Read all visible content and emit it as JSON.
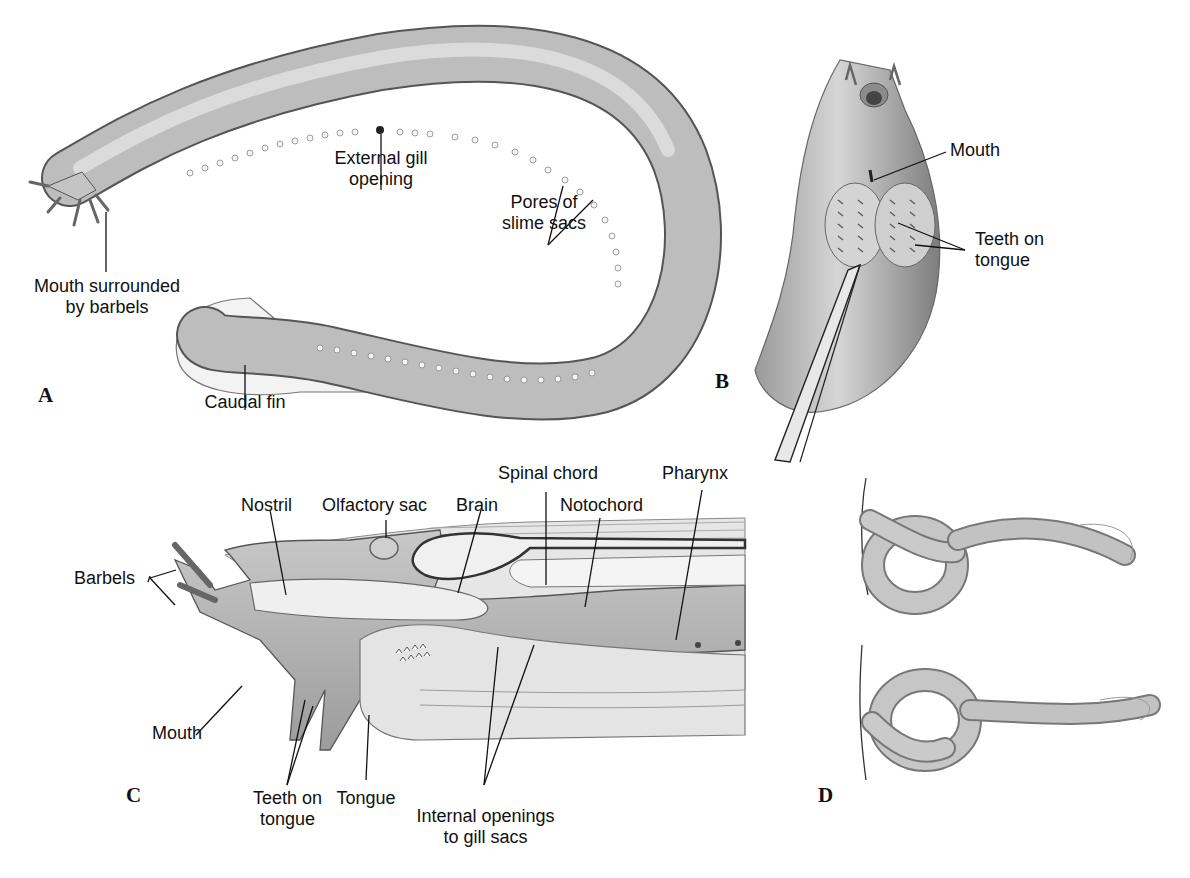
{
  "figure": {
    "panels": [
      {
        "id": "A",
        "letter": "A",
        "labels": {
          "mouth": "Mouth surrounded\nby barbels",
          "mouth_line1": "Mouth surrounded",
          "mouth_line2": "by barbels",
          "gill_line1": "External gill",
          "gill_line2": "opening",
          "pores_line1": "Pores of",
          "pores_line2": "slime sacs",
          "caudal": "Caudal fin"
        }
      },
      {
        "id": "B",
        "letter": "B",
        "labels": {
          "mouth": "Mouth",
          "teeth_line1": "Teeth on",
          "teeth_line2": "tongue"
        }
      },
      {
        "id": "C",
        "letter": "C",
        "labels": {
          "barbels": "Barbels",
          "nostril": "Nostril",
          "olfactory": "Olfactory sac",
          "brain": "Brain",
          "spinal": "Spinal chord",
          "notochord": "Notochord",
          "pharynx": "Pharynx",
          "mouth": "Mouth",
          "teeth_line1": "Teeth on",
          "teeth_line2": "tongue",
          "tongue": "Tongue",
          "gill_line1": "Internal openings",
          "gill_line2": "to gill sacs"
        }
      },
      {
        "id": "D",
        "letter": "D",
        "labels": {}
      }
    ]
  },
  "colors": {
    "body_fill": "#b9b9b9",
    "body_light": "#d8d8d8",
    "outline": "#3a3a3a",
    "fin": "#f2f2f2",
    "text": "#111111",
    "background": "#ffffff"
  }
}
